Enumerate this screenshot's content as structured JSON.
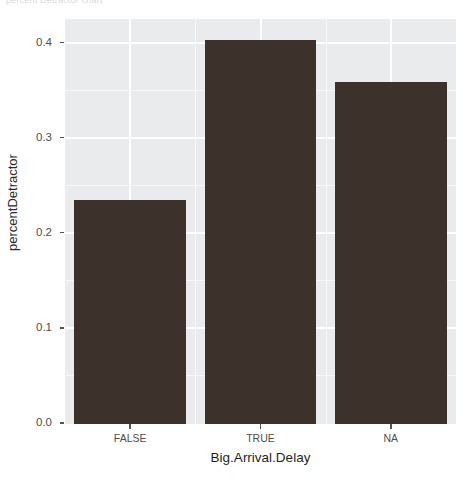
{
  "chart_data": {
    "type": "bar",
    "title": "percent Detractor chart",
    "categories": [
      "FALSE",
      "TRUE",
      "NA"
    ],
    "values": [
      0.236,
      0.404,
      0.36
    ],
    "xlabel": "Big.Arrival.Delay",
    "ylabel": "percentDetractor",
    "ylim": [
      0.0,
      0.425
    ],
    "y_ticks": [
      "0.0",
      "0.1",
      "0.2",
      "0.3",
      "0.4"
    ],
    "y_tick_values": [
      0.0,
      0.1,
      0.2,
      0.3,
      0.4
    ],
    "y_minor_tick_values": [
      0.05,
      0.15,
      0.25,
      0.35
    ],
    "grid": true,
    "legend": "none",
    "bar_color": "#3c312b",
    "panel_background": "#eaebed",
    "grid_color": "#ffffff"
  },
  "axes": {
    "y": {
      "title": "percentDetractor",
      "ticks": [
        {
          "label": "0.4",
          "value": 0.4
        },
        {
          "label": "0.3",
          "value": 0.3
        },
        {
          "label": "0.2",
          "value": 0.2
        },
        {
          "label": "0.1",
          "value": 0.1
        },
        {
          "label": "0.0",
          "value": 0.0
        }
      ]
    },
    "x": {
      "title": "Big.Arrival.Delay",
      "ticks": [
        {
          "label": "FALSE"
        },
        {
          "label": "TRUE"
        },
        {
          "label": "NA"
        }
      ]
    }
  },
  "bars": [
    {
      "category": "FALSE",
      "value": 0.236
    },
    {
      "category": "TRUE",
      "value": 0.404
    },
    {
      "category": "NA",
      "value": 0.36
    }
  ]
}
